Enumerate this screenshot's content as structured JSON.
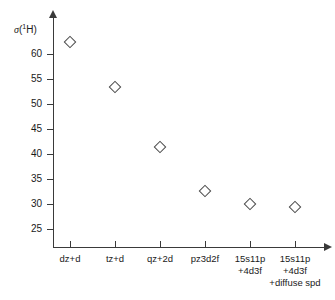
{
  "chart_data": {
    "type": "scatter",
    "title": "",
    "xlabel": "",
    "ylabel": "σ(¹H)",
    "ylabel_symbol": "σ",
    "ylabel_super": "1",
    "ylabel_nucleus": "H",
    "categories": [
      "dz+d",
      "tz+d",
      "qz+2d",
      "pz3d2f",
      "15s11p\n+4d3f",
      "15s11p\n+4d3f\n+diffuse spd"
    ],
    "category_lines": [
      [
        "dz+d"
      ],
      [
        "tz+d"
      ],
      [
        "qz+2d"
      ],
      [
        "pz3d2f"
      ],
      [
        "15s11p",
        "+4d3f"
      ],
      [
        "15s11p",
        "+4d3f",
        "+diffuse spd"
      ]
    ],
    "values": [
      62.4,
      53.5,
      41.4,
      32.6,
      30.0,
      29.5
    ],
    "ylim": [
      22.5,
      64.5
    ],
    "yticks": [
      25,
      30,
      35,
      40,
      45,
      50,
      55,
      60
    ],
    "ytick_labels": [
      "25",
      "30",
      "35",
      "40",
      "45",
      "50",
      "55",
      "60"
    ],
    "marker": "open-diamond",
    "marker_color": "#4a4a4a",
    "axis_color": "#3a3a3a",
    "grid": false,
    "legend": false,
    "background": "#ffffff"
  },
  "axes": {
    "y_axis_name": "sigma-1H-axis",
    "x_axis_name": "basis-set-axis"
  }
}
